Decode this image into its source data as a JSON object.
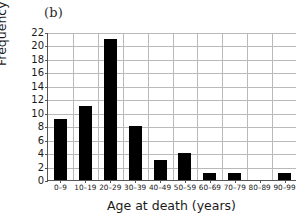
{
  "panel": {
    "label": "(b)"
  },
  "chart_data": {
    "type": "bar",
    "title": "",
    "subtitle": "",
    "xlabel": "Age at death (years)",
    "ylabel": "Frequency",
    "categories": [
      "0–9",
      "10–19",
      "20–29",
      "30–39",
      "40–49",
      "50–59",
      "60–69",
      "70–79",
      "80–89",
      "90–99"
    ],
    "values": [
      9,
      11,
      21,
      8,
      3,
      4,
      1,
      1,
      0,
      1
    ],
    "ylim": [
      0,
      22
    ],
    "ytick_step": 2,
    "yticks": [
      0,
      2,
      4,
      6,
      8,
      10,
      12,
      14,
      16,
      18,
      20,
      22
    ],
    "ytick_labels": [
      "0",
      "2",
      "4",
      "6",
      "8",
      "10",
      "12",
      "14",
      "16",
      "18",
      "20",
      "22"
    ],
    "grid": true,
    "grid_axes": "both",
    "legend": null,
    "bar_color": "#000000",
    "grid_color": "#b9b9b9",
    "axis_color": "#555555"
  }
}
